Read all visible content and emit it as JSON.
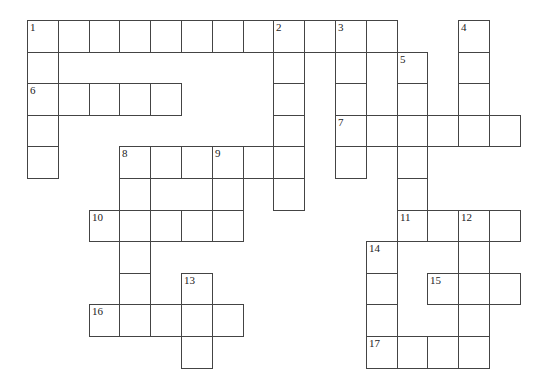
{
  "puzzle": {
    "type": "crossword",
    "grid_origin": {
      "x": 27,
      "y": 20
    },
    "cell_size": {
      "w": 30.8,
      "h": 31.6
    },
    "cells": [
      [
        0,
        0,
        "1"
      ],
      [
        1,
        0,
        ""
      ],
      [
        2,
        0,
        ""
      ],
      [
        3,
        0,
        ""
      ],
      [
        4,
        0,
        ""
      ],
      [
        5,
        0,
        ""
      ],
      [
        6,
        0,
        ""
      ],
      [
        7,
        0,
        ""
      ],
      [
        8,
        0,
        "2"
      ],
      [
        9,
        0,
        ""
      ],
      [
        10,
        0,
        "3"
      ],
      [
        11,
        0,
        ""
      ],
      [
        14,
        0,
        "4"
      ],
      [
        0,
        1,
        ""
      ],
      [
        8,
        1,
        ""
      ],
      [
        10,
        1,
        ""
      ],
      [
        12,
        1,
        "5"
      ],
      [
        14,
        1,
        ""
      ],
      [
        0,
        2,
        "6"
      ],
      [
        1,
        2,
        ""
      ],
      [
        2,
        2,
        ""
      ],
      [
        3,
        2,
        ""
      ],
      [
        4,
        2,
        ""
      ],
      [
        8,
        2,
        ""
      ],
      [
        10,
        2,
        ""
      ],
      [
        12,
        2,
        ""
      ],
      [
        14,
        2,
        ""
      ],
      [
        0,
        3,
        ""
      ],
      [
        8,
        3,
        ""
      ],
      [
        10,
        3,
        "7"
      ],
      [
        11,
        3,
        ""
      ],
      [
        12,
        3,
        ""
      ],
      [
        13,
        3,
        ""
      ],
      [
        14,
        3,
        ""
      ],
      [
        15,
        3,
        ""
      ],
      [
        0,
        4,
        ""
      ],
      [
        3,
        4,
        "8"
      ],
      [
        4,
        4,
        ""
      ],
      [
        5,
        4,
        ""
      ],
      [
        6,
        4,
        "9"
      ],
      [
        7,
        4,
        ""
      ],
      [
        8,
        4,
        ""
      ],
      [
        10,
        4,
        ""
      ],
      [
        12,
        4,
        ""
      ],
      [
        3,
        5,
        ""
      ],
      [
        6,
        5,
        ""
      ],
      [
        8,
        5,
        ""
      ],
      [
        12,
        5,
        ""
      ],
      [
        2,
        6,
        "10"
      ],
      [
        3,
        6,
        ""
      ],
      [
        4,
        6,
        ""
      ],
      [
        5,
        6,
        ""
      ],
      [
        6,
        6,
        ""
      ],
      [
        12,
        6,
        "11"
      ],
      [
        13,
        6,
        ""
      ],
      [
        14,
        6,
        "12"
      ],
      [
        15,
        6,
        ""
      ],
      [
        3,
        7,
        ""
      ],
      [
        11,
        7,
        "14"
      ],
      [
        14,
        7,
        ""
      ],
      [
        3,
        8,
        ""
      ],
      [
        5,
        8,
        "13"
      ],
      [
        11,
        8,
        ""
      ],
      [
        13,
        8,
        "15"
      ],
      [
        14,
        8,
        ""
      ],
      [
        15,
        8,
        ""
      ],
      [
        2,
        9,
        "16"
      ],
      [
        3,
        9,
        ""
      ],
      [
        4,
        9,
        ""
      ],
      [
        5,
        9,
        ""
      ],
      [
        6,
        9,
        ""
      ],
      [
        11,
        9,
        ""
      ],
      [
        14,
        9,
        ""
      ],
      [
        5,
        10,
        ""
      ],
      [
        11,
        10,
        "17"
      ],
      [
        12,
        10,
        ""
      ],
      [
        13,
        10,
        ""
      ],
      [
        14,
        10,
        ""
      ]
    ],
    "clue_numbers": [
      "1",
      "2",
      "3",
      "4",
      "5",
      "6",
      "7",
      "8",
      "9",
      "10",
      "11",
      "12",
      "13",
      "14",
      "15",
      "16",
      "17"
    ]
  }
}
